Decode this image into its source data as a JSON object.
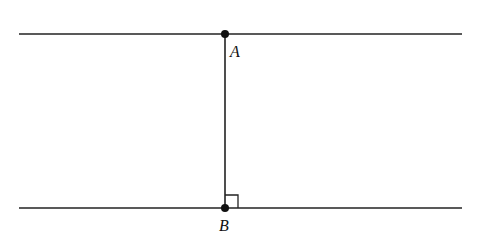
{
  "diagram": {
    "lines": [
      {
        "name": "top-parallel-line",
        "x1": 19,
        "y1": 34,
        "x2": 462,
        "y2": 34
      },
      {
        "name": "bottom-parallel-line",
        "x1": 19,
        "y1": 208,
        "x2": 462,
        "y2": 208
      },
      {
        "name": "perpendicular-segment-AB",
        "x1": 225,
        "y1": 34,
        "x2": 225,
        "y2": 208
      }
    ],
    "points": [
      {
        "label": "A",
        "x": 225,
        "y": 34,
        "label_x": 230,
        "label_y": 57
      },
      {
        "label": "B",
        "x": 225,
        "y": 208,
        "label_x": 219,
        "label_y": 231
      }
    ],
    "right_angle_marker": {
      "at": "B",
      "size": 12
    },
    "colors": {
      "stroke": "#222222",
      "background": "#ffffff"
    }
  }
}
